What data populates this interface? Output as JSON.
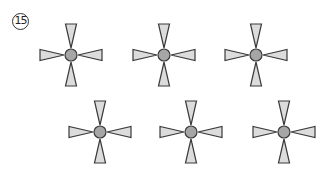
{
  "problem": {
    "number_label": "15"
  },
  "colors": {
    "triangle_fill": "#dcdcdc",
    "circle_fill": "#a6a6a6",
    "stroke": "#3a3a3a",
    "background": "#ffffff"
  },
  "figures": [
    {
      "id": 1,
      "cx": 71,
      "cy": 55,
      "top": "inward",
      "right": "inward",
      "bottom": "inward",
      "left": "inward"
    },
    {
      "id": 2,
      "cx": 164,
      "cy": 55,
      "top": "inward",
      "right": "inward",
      "bottom": "inward",
      "left": "inward"
    },
    {
      "id": 3,
      "cx": 256,
      "cy": 55,
      "top": "inward",
      "right": "inward",
      "bottom": "inward",
      "left": "inward"
    },
    {
      "id": 4,
      "cx": 100,
      "cy": 132,
      "top": "inward",
      "right": "inward",
      "bottom": "inward",
      "left": "inward"
    },
    {
      "id": 5,
      "cx": 191,
      "cy": 132,
      "top": "inward",
      "right": "inward",
      "bottom": "inward",
      "left": "inward"
    },
    {
      "id": 6,
      "cx": 284,
      "cy": 132,
      "top": "inward",
      "right": "inward",
      "bottom": "inward",
      "left": "inward"
    }
  ]
}
